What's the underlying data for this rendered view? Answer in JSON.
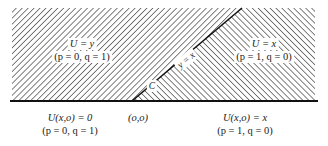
{
  "diagram": {
    "type": "characteristic-regions",
    "colors": {
      "hatch": "#555555",
      "line": "#111111",
      "background": "#ffffff"
    },
    "regions": {
      "left": {
        "label_eq": "U = y",
        "label_pq": "(p = 0,  q = 1)",
        "hatch": "forward-slash"
      },
      "right": {
        "label_eq": "U = x",
        "label_pq": "(p = 1, q = 0)",
        "hatch": "back-slash"
      }
    },
    "curve": {
      "label_eq": "y = x",
      "label_name": "C"
    },
    "boundary": {
      "origin_label": "(o,o)",
      "left": {
        "label_eq": "U(x,o) = 0",
        "label_pq": "(p = 0, q = 1)"
      },
      "right": {
        "label_eq": "U(x,o) = x",
        "label_pq": "(p = 1, q = 0)"
      }
    }
  }
}
